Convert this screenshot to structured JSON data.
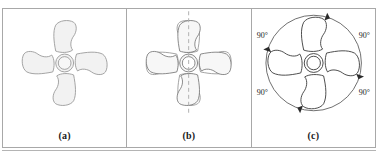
{
  "figure": {
    "faint_cut_text": "",
    "panels": [
      {
        "id": "a",
        "caption": "(a)",
        "description": "four-blade impeller, light gray fill, no symmetry marks",
        "shape_fill": "#f2f2f2",
        "shape_stroke": "#9a9a9a",
        "blade_count": 4,
        "has_mirror_axis": false,
        "has_rotation_circle": false,
        "angle_labels": []
      },
      {
        "id": "b",
        "caption": "(b)",
        "description": "impeller with vertical dashed mirror axis and mirrored outline overlay",
        "shape_fill": "#f7f7f7",
        "shape_stroke": "#6e6e6e",
        "mirror_stroke": "#8c8c8c",
        "axis_color": "#b0b0b0",
        "blade_count": 4,
        "has_mirror_axis": true,
        "has_rotation_circle": false,
        "angle_labels": []
      },
      {
        "id": "c",
        "caption": "(c)",
        "description": "impeller inside rotation circle with four clockwise arrowheads and four 90 degree labels",
        "shape_fill": "#ffffff",
        "shape_stroke": "#3a3a3a",
        "circle_stroke": "#4a4a4a",
        "blade_count": 4,
        "has_mirror_axis": false,
        "has_rotation_circle": true,
        "rotation_direction": "clockwise",
        "angle_labels": [
          "90°",
          "90°",
          "90°",
          "90°"
        ],
        "angle_label_positions": [
          "top-left",
          "top-right",
          "bottom-left",
          "bottom-right"
        ]
      }
    ],
    "colors": {
      "border": "#a8a8a8",
      "background": "#ffffff",
      "caption_text": "#1a1a1a",
      "label_text": "#1a1a1a"
    }
  }
}
